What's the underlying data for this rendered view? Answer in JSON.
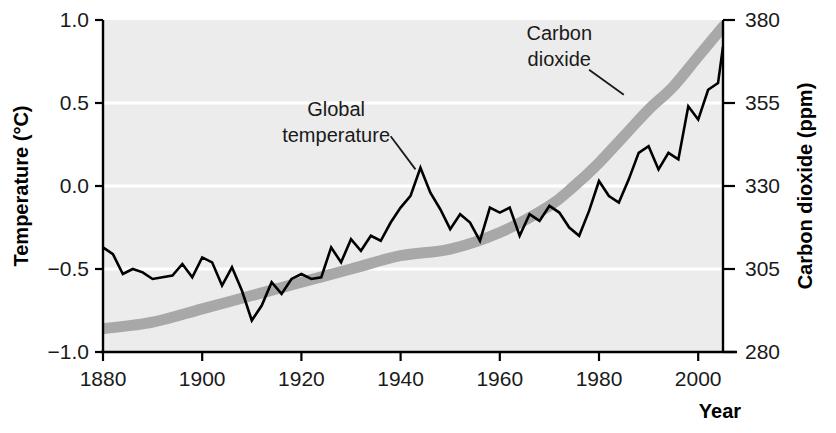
{
  "chart_data": {
    "type": "line",
    "title": "",
    "xlabel": "Year",
    "ylabel": "Temperature (°C)",
    "y2label": "Carbon dioxide (ppm)",
    "grid": true,
    "legend": "annotations-inline",
    "xlim": [
      1880,
      2005
    ],
    "ylim": [
      -1.0,
      1.0
    ],
    "y2lim": [
      280,
      380
    ],
    "xticks": [
      1880,
      1900,
      1920,
      1940,
      1960,
      1980,
      2000
    ],
    "xtick_labels": [
      "1880",
      "1900",
      "1920",
      "1940",
      "1960",
      "1980",
      "2000"
    ],
    "yticks": [
      -1.0,
      -0.5,
      0.0,
      0.5,
      1.0
    ],
    "ytick_labels": [
      "-1.0",
      "-0.5",
      "0.0",
      "0.5",
      "1.0"
    ],
    "y2ticks": [
      280,
      305,
      330,
      355,
      380
    ],
    "y2tick_labels": [
      "280",
      "305",
      "330",
      "355",
      "380"
    ],
    "annotations": [
      {
        "name": "global-temperature",
        "text_line1": "Global",
        "text_line2": "temperature",
        "text_x": 1927,
        "text_y": 0.42,
        "leader_from_x": 1938,
        "leader_from_y": 0.3,
        "leader_to_x": 1943,
        "leader_to_y": 0.1
      },
      {
        "name": "carbon-dioxide",
        "text_line1": "Carbon",
        "text_line2": "dioxide",
        "text_x": 1972,
        "text_y": 0.88,
        "leader_from_x": 1978,
        "leader_from_y": 0.7,
        "leader_to_x": 1985,
        "leader_to_y": 0.55
      }
    ],
    "series": [
      {
        "name": "Global temperature",
        "axis": "left",
        "unit": "°C",
        "color": "#000000",
        "style": "jagged-line",
        "x": [
          1880,
          1882,
          1884,
          1886,
          1888,
          1890,
          1892,
          1894,
          1896,
          1898,
          1900,
          1902,
          1904,
          1906,
          1908,
          1910,
          1912,
          1914,
          1916,
          1918,
          1920,
          1922,
          1924,
          1926,
          1928,
          1930,
          1932,
          1934,
          1936,
          1938,
          1940,
          1942,
          1944,
          1946,
          1948,
          1950,
          1952,
          1954,
          1956,
          1958,
          1960,
          1962,
          1964,
          1966,
          1968,
          1970,
          1972,
          1974,
          1976,
          1978,
          1980,
          1982,
          1984,
          1986,
          1988,
          1990,
          1992,
          1994,
          1996,
          1998,
          2000,
          2002,
          2004,
          2005
        ],
        "values": [
          -0.37,
          -0.41,
          -0.53,
          -0.5,
          -0.52,
          -0.56,
          -0.55,
          -0.54,
          -0.47,
          -0.55,
          -0.43,
          -0.46,
          -0.6,
          -0.49,
          -0.63,
          -0.81,
          -0.72,
          -0.58,
          -0.65,
          -0.56,
          -0.53,
          -0.56,
          -0.55,
          -0.37,
          -0.46,
          -0.32,
          -0.39,
          -0.3,
          -0.33,
          -0.22,
          -0.13,
          -0.06,
          0.11,
          -0.04,
          -0.14,
          -0.26,
          -0.17,
          -0.22,
          -0.33,
          -0.13,
          -0.16,
          -0.13,
          -0.3,
          -0.17,
          -0.21,
          -0.12,
          -0.16,
          -0.25,
          -0.3,
          -0.15,
          0.03,
          -0.06,
          -0.1,
          0.04,
          0.2,
          0.24,
          0.1,
          0.2,
          0.16,
          0.48,
          0.4,
          0.58,
          0.62,
          0.84
        ]
      },
      {
        "name": "Carbon dioxide",
        "axis": "right",
        "unit": "ppm",
        "color": "#a8a8a8",
        "style": "thick-band",
        "x": [
          1880,
          1890,
          1900,
          1910,
          1920,
          1930,
          1940,
          1950,
          1960,
          1970,
          1975,
          1980,
          1985,
          1990,
          1995,
          2000,
          2005
        ],
        "values": [
          287,
          289,
          293,
          297,
          301,
          305,
          309,
          311,
          316,
          324,
          330,
          337,
          345,
          353,
          360,
          369,
          378
        ]
      }
    ]
  },
  "colors": {
    "plot_background": "#ececec",
    "gridline": "#ffffff",
    "axis": "#000000",
    "temperature_line": "#000000",
    "co2_band": "#a8a8a8",
    "text": "#1a1a1a"
  }
}
